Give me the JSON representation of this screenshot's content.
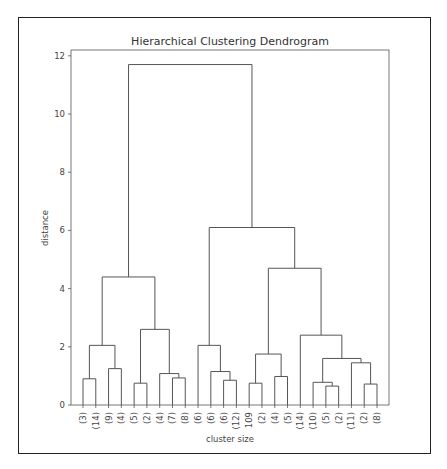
{
  "chart_data": {
    "type": "dendrogram",
    "title": "Hierarchical Clustering Dendrogram",
    "xlabel": "cluster size",
    "ylabel": "distance",
    "ylim": [
      0,
      12.2
    ],
    "yticks": [
      0,
      2,
      4,
      6,
      8,
      10,
      12
    ],
    "grid": false,
    "leaves": [
      "(3)",
      "(14)",
      "(9)",
      "(4)",
      "(5)",
      "(2)",
      "(4)",
      "(7)",
      "(8)",
      "(6)",
      "(6)",
      "(6)",
      "(12)",
      "109",
      "(2)",
      "(4)",
      "(5)",
      "(14)",
      "(10)",
      "(5)",
      "(2)",
      "(11)",
      "(2)",
      "(8)"
    ],
    "merges": [
      {
        "left": [
          0
        ],
        "right": [
          1
        ],
        "height": 0.9
      },
      {
        "left": [
          2
        ],
        "right": [
          3
        ],
        "height": 1.25
      },
      {
        "left": [
          0,
          1
        ],
        "right": [
          2,
          3
        ],
        "height": 2.05
      },
      {
        "left": [
          4
        ],
        "right": [
          5
        ],
        "height": 0.75
      },
      {
        "left": [
          7
        ],
        "right": [
          8
        ],
        "height": 0.93
      },
      {
        "left": [
          6
        ],
        "right": [
          7,
          8
        ],
        "height": 1.08
      },
      {
        "left": [
          4,
          5
        ],
        "right": [
          6,
          7,
          8
        ],
        "height": 2.6
      },
      {
        "left": [
          0,
          1,
          2,
          3
        ],
        "right": [
          4,
          5,
          6,
          7,
          8
        ],
        "height": 4.4
      },
      {
        "left": [
          11
        ],
        "right": [
          12
        ],
        "height": 0.85
      },
      {
        "left": [
          10
        ],
        "right": [
          11,
          12
        ],
        "height": 1.15
      },
      {
        "left": [
          9
        ],
        "right": [
          10,
          11,
          12
        ],
        "height": 2.05
      },
      {
        "left": [
          13
        ],
        "right": [
          14
        ],
        "height": 0.75
      },
      {
        "left": [
          15
        ],
        "right": [
          16
        ],
        "height": 0.98
      },
      {
        "left": [
          13,
          14
        ],
        "right": [
          15,
          16
        ],
        "height": 1.75
      },
      {
        "left": [
          19
        ],
        "right": [
          20
        ],
        "height": 0.65
      },
      {
        "left": [
          18
        ],
        "right": [
          19,
          20
        ],
        "height": 0.78
      },
      {
        "left": [
          22
        ],
        "right": [
          23
        ],
        "height": 0.72
      },
      {
        "left": [
          21
        ],
        "right": [
          22,
          23
        ],
        "height": 1.45
      },
      {
        "left": [
          18,
          19,
          20
        ],
        "right": [
          21,
          22,
          23
        ],
        "height": 1.6
      },
      {
        "left": [
          17
        ],
        "right": [
          18,
          19,
          20,
          21,
          22,
          23
        ],
        "height": 2.4
      },
      {
        "left": [
          13,
          14,
          15,
          16
        ],
        "right": [
          17,
          18,
          19,
          20,
          21,
          22,
          23
        ],
        "height": 4.7
      },
      {
        "left": [
          9,
          10,
          11,
          12
        ],
        "right": [
          13,
          14,
          15,
          16,
          17,
          18,
          19,
          20,
          21,
          22,
          23
        ],
        "height": 6.1
      },
      {
        "left": [
          0,
          1,
          2,
          3,
          4,
          5,
          6,
          7,
          8
        ],
        "right": [
          9,
          10,
          11,
          12,
          13,
          14,
          15,
          16,
          17,
          18,
          19,
          20,
          21,
          22,
          23
        ],
        "height": 11.7
      }
    ],
    "line_color": "#555555"
  }
}
